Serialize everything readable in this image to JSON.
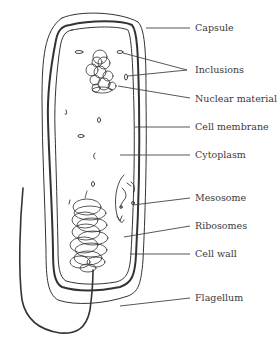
{
  "diagram": {
    "labels": [
      {
        "id": "capsule",
        "text": "Capsule"
      },
      {
        "id": "inclusions",
        "text": "Inclusions"
      },
      {
        "id": "nuclear-material",
        "text": "Nuclear material"
      },
      {
        "id": "cell-membrane",
        "text": "Cell membrane"
      },
      {
        "id": "cytoplasm",
        "text": "Cytoplasm"
      },
      {
        "id": "mesosome",
        "text": "Mesosome"
      },
      {
        "id": "ribosomes",
        "text": "Ribosomes"
      },
      {
        "id": "cell-wall",
        "text": "Cell wall"
      },
      {
        "id": "flagellum",
        "text": "Flagellum"
      }
    ],
    "colors": {
      "line": "#333333",
      "text": "#3a3a3a",
      "background": "#ffffff"
    }
  }
}
